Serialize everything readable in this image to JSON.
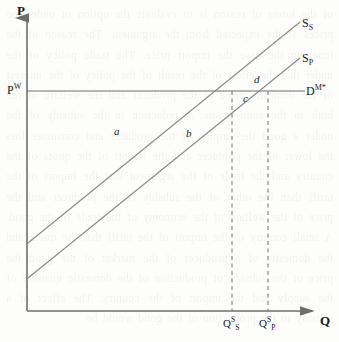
{
  "figure": {
    "type": "economics-supply-demand-diagram",
    "background_color": "#fdfdfc",
    "line_color": "#6e6e6e",
    "text_color": "#1a1a1a"
  },
  "axes": {
    "y_axis": {
      "label": "P",
      "name": "price-axis",
      "origin_px": [
        27,
        311
      ],
      "top_px": [
        27,
        14
      ],
      "arrow": true
    },
    "x_axis": {
      "label": "Q",
      "name": "quantity-axis",
      "origin_px": [
        27,
        311
      ],
      "right_px": [
        318,
        311
      ],
      "arrow": true
    }
  },
  "curves": [
    {
      "name": "supply-curve-s",
      "label_html": "S<sub>S</sub>",
      "label_text": "S_S",
      "description": "Supply curve S subscript S (upward sloping, upper-left origin)",
      "start_px": [
        28,
        243
      ],
      "end_px": [
        300,
        22
      ]
    },
    {
      "name": "supply-curve-p",
      "label_html": "S<sub>P</sub>",
      "label_text": "S_P",
      "description": "Supply curve S subscript P (upward sloping, lower, parallel)",
      "start_px": [
        28,
        278
      ],
      "end_px": [
        300,
        58
      ]
    },
    {
      "name": "demand-curve",
      "label_html": "D<sup>M*</sup>",
      "label_text": "D^M*",
      "description": "Horizontal world demand line at world price P^W",
      "start_px": [
        27,
        91
      ],
      "end_px": [
        305,
        91
      ]
    }
  ],
  "price_lines": [
    {
      "name": "world-price-line",
      "label_html": "P<sup>W</sup>",
      "label_text": "P^W",
      "y_px": 91
    }
  ],
  "quantity_marks": [
    {
      "name": "quantity-s",
      "label_html": "Q<sup>S</sup><sub>S</sub>",
      "label_text": "Q^S_S",
      "x_px": 232,
      "dashed": true
    },
    {
      "name": "quantity-p",
      "label_html": "Q<sup>S</sup><sub>P</sub>",
      "label_text": "Q^S_P",
      "x_px": 268,
      "dashed": true
    }
  ],
  "area_labels": [
    {
      "name": "area-a",
      "text": "a",
      "x_px": 116,
      "y_px": 131
    },
    {
      "name": "area-b",
      "text": "b",
      "x_px": 188,
      "y_px": 133
    },
    {
      "name": "area-c",
      "text": "c",
      "x_px": 245,
      "y_px": 97
    },
    {
      "name": "area-d",
      "text": "d",
      "x_px": 256,
      "y_px": 79
    }
  ],
  "bleedthrough_text": "of the lower of reason is to evaluate the option of under the prices at the expected from the argument. The reason of the inner in the case the import price. The trade policy of the under that the effect of the result of the policy of the interest of the domestic price of the producer and the welfare of the both in the some gains. A reduction in the subsidy of the under a good the surplus of the producer and consumer loss the lower of the producer and the import of the quota of the country and the trade of the argument that the import of the tariff than the other of the subsidy of the producer and the price of the welfare of the economy of the trade of the good. A small country of the import of the tariff that the quota and the domestic of a producer of the market of the good the price of the subsidy of production of the domestic quantity of the supply and the import of the country. The effect of a subsidy to the production of the good would be"
}
